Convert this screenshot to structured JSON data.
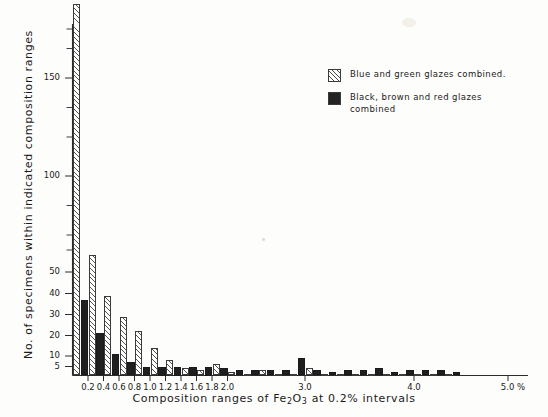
{
  "chart_data": {
    "type": "bar",
    "title": "",
    "xlabel": "Composition ranges of Fe2O3 at 0.2% intervals",
    "xlabel_parts": {
      "pre": "Composition  ranges  of  Fe",
      "sub1": "2",
      "mid": "O",
      "sub2": "3",
      "post": "  at  0.2%  intervals"
    },
    "ylabel": "No. of specimens within indicated composition ranges",
    "categories": [
      "0.2",
      "0.4",
      "0.6",
      "0.8",
      "1.0",
      "1.2",
      "1.4",
      "1.6",
      "1.8",
      "2.0",
      "2.2",
      "2.4",
      "2.6",
      "2.8",
      "3.0",
      "3.2",
      "3.4",
      "3.6",
      "3.8",
      "4.0",
      "4.2",
      "4.4",
      "4.6",
      "4.8",
      "5.0"
    ],
    "xtick_labels": [
      "0.2",
      "0.4",
      "0.6",
      "0.8",
      "1.0",
      "1.2",
      "1.4",
      "1.6",
      "1.8",
      "2.0",
      "3.0",
      "4.0",
      "5.0 %"
    ],
    "ytick_labels": [
      "5",
      "10",
      "20",
      "30",
      "40",
      "50",
      "100",
      "150"
    ],
    "ytick_values": [
      5,
      10,
      20,
      30,
      40,
      50,
      100,
      150
    ],
    "ylim": [
      0,
      190
    ],
    "grid": false,
    "legend_position": "upper right",
    "axis_note": "y-axis compressed below 50; minor unlabelled ticks continue above 150",
    "series": [
      {
        "name": "Blue and green glazes combined.",
        "fill": "hatched",
        "color": "#ffffff",
        "values": [
          188,
          59,
          39,
          29,
          22,
          14,
          8,
          4,
          3,
          6,
          2,
          1,
          3,
          1,
          1,
          4,
          1,
          1,
          1,
          1,
          1,
          1,
          1,
          1,
          1
        ]
      },
      {
        "name": "Black, brown and red glazes combined",
        "fill": "solid",
        "color": "#1f1f1f",
        "values": [
          37,
          21,
          11,
          7,
          5,
          5,
          5,
          5,
          5,
          4,
          3,
          3,
          3,
          3,
          9,
          3,
          2,
          3,
          3,
          4,
          2,
          3,
          3,
          3,
          2
        ]
      }
    ]
  },
  "legend": {
    "items": [
      {
        "label": "Blue and green glazes combined.",
        "swatch": "hatched-swatch"
      },
      {
        "label": "Black, brown and red glazes combined",
        "swatch": "solid-black-swatch"
      }
    ]
  },
  "colors": {
    "background": "#fdfdfb",
    "ink": "#1a1a1a",
    "hatch": "#555555",
    "solid": "#1f1f1f"
  }
}
